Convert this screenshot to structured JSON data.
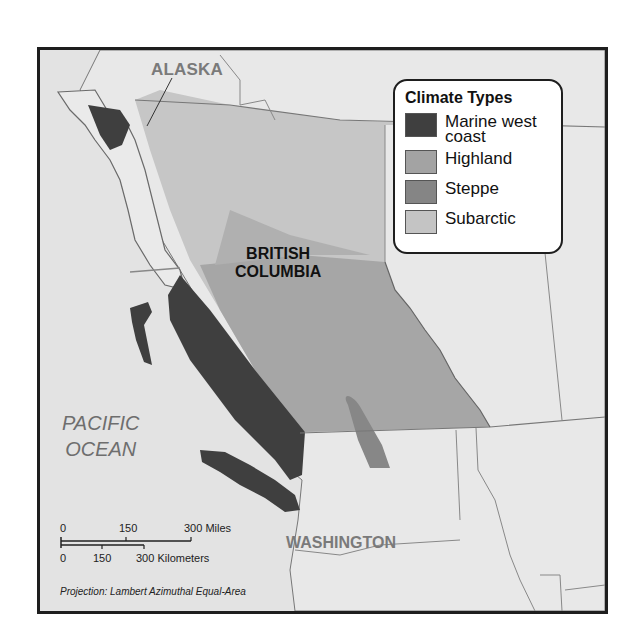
{
  "map": {
    "labels": {
      "alaska": "ALASKA",
      "bc_line1": "BRITISH",
      "bc_line2": "COLUMBIA",
      "pacific_line1": "PACIFIC",
      "pacific_line2": "OCEAN",
      "washington": "WASHINGTON"
    },
    "legend": {
      "title": "Climate Types",
      "items": [
        {
          "label_line1": "Marine west",
          "label_line2": "coast",
          "color": "#3f3f3f"
        },
        {
          "label_line1": "Highland",
          "label_line2": "",
          "color": "#a3a3a3"
        },
        {
          "label_line1": "Steppe",
          "label_line2": "",
          "color": "#858585"
        },
        {
          "label_line1": "Subarctic",
          "label_line2": "",
          "color": "#c4c4c4"
        }
      ]
    },
    "scale": {
      "miles": {
        "ticks": [
          "0",
          "150",
          "300 Miles"
        ]
      },
      "kilometers": {
        "ticks": [
          "0",
          "150",
          "300 Kilometers"
        ]
      }
    },
    "projection": "Projection: Lambert Azimuthal Equal-Area"
  }
}
